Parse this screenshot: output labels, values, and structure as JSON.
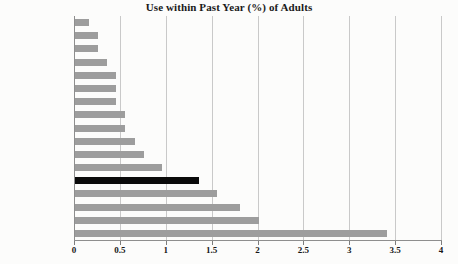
{
  "chart_data": {
    "type": "bar",
    "orientation": "horizontal",
    "title": "Use within Past Year (%) of Adults",
    "xlabel": "",
    "ylabel": "",
    "xlim": [
      0,
      4
    ],
    "xticks": [
      "0",
      "0.5",
      "1",
      "1.5",
      "2",
      "2.5",
      "3",
      "3.5",
      "4"
    ],
    "xtick_values": [
      0,
      0.5,
      1,
      1.5,
      2,
      2.5,
      3,
      3.5,
      4
    ],
    "grid": "vertical",
    "legend": "none",
    "categories": [
      "Greece",
      "Italy",
      "Sweden",
      "France",
      "Luxembourg",
      "Portugal",
      "Switzerland",
      "Denmark",
      "Finland",
      "Austria",
      "Germany",
      "Belgium",
      "United States",
      "Netherlands",
      "Spain",
      "United Kingdom",
      "Ireland"
    ],
    "values": [
      0.15,
      0.25,
      0.25,
      0.35,
      0.45,
      0.45,
      0.45,
      0.55,
      0.55,
      0.65,
      0.75,
      0.95,
      1.35,
      1.55,
      1.8,
      2.0,
      3.4
    ],
    "bar_color": "#9d9d9d",
    "highlight_color": "#0a0a0a",
    "highlight_category": "United States"
  }
}
